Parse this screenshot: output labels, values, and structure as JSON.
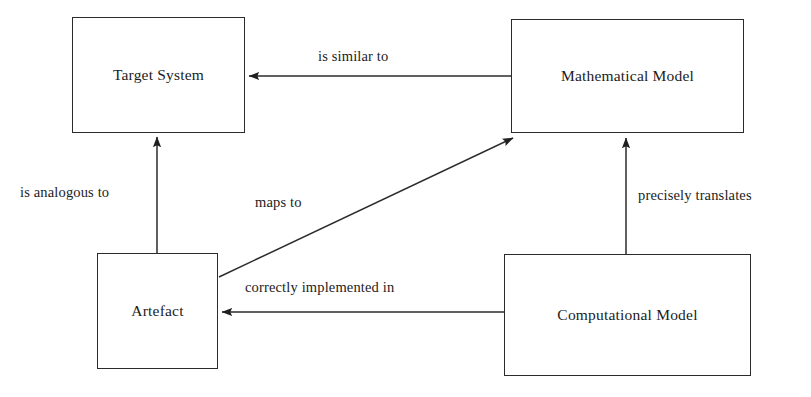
{
  "diagram": {
    "type": "node-edge-diagram",
    "background_color": "#ffffff",
    "stroke_color": "#2b2b2b",
    "text_color": "#1c1c1c",
    "nodes": [
      {
        "id": "target-system",
        "label": "Target System",
        "x": 72,
        "y": 17,
        "width": 173,
        "height": 116
      },
      {
        "id": "mathematical-model",
        "label": "Mathematical Model",
        "x": 511,
        "y": 19,
        "width": 233,
        "height": 114
      },
      {
        "id": "artefact",
        "label": "Artefact",
        "x": 97,
        "y": 253,
        "width": 121,
        "height": 116
      },
      {
        "id": "computational-model",
        "label": "Computational Model",
        "x": 504,
        "y": 254,
        "width": 247,
        "height": 122
      }
    ],
    "edges": [
      {
        "id": "is-similar-to",
        "label": "is similar to",
        "from": "mathematical-model",
        "to": "target-system",
        "direction": "right-to-left"
      },
      {
        "id": "is-analogous-to",
        "label": "is analogous to",
        "from": "artefact",
        "to": "target-system",
        "direction": "bottom-to-top"
      },
      {
        "id": "maps-to",
        "label": "maps to",
        "from": "artefact",
        "to": "mathematical-model",
        "direction": "diagonal-up-right"
      },
      {
        "id": "precisely-translates",
        "label": "precisely translates",
        "from": "computational-model",
        "to": "mathematical-model",
        "direction": "bottom-to-top"
      },
      {
        "id": "correctly-implemented-in",
        "label": "correctly implemented in",
        "from": "computational-model",
        "to": "artefact",
        "direction": "right-to-left"
      }
    ]
  }
}
